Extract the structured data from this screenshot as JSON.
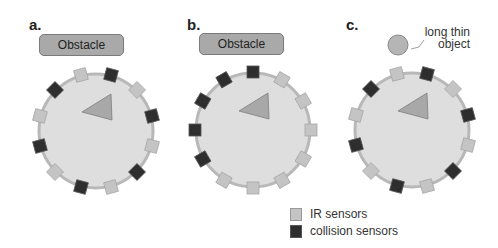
{
  "panels": [
    {
      "label": "a.",
      "target": "Obstacle",
      "target_type": "obstacle-box",
      "center": [
        96,
        131
      ],
      "sensor_start_angle": -105,
      "sensor_pattern": [
        "ir",
        "collision",
        "ir",
        "collision",
        "ir",
        "collision",
        "ir",
        "collision",
        "ir",
        "collision",
        "ir",
        "collision"
      ]
    },
    {
      "label": "b.",
      "target": "Obstacle",
      "target_type": "obstacle-box",
      "center": [
        253,
        130
      ],
      "sensor_start_angle": -90,
      "sensor_pattern": [
        "collision",
        "ir",
        "ir",
        "ir",
        "ir",
        "ir",
        "ir",
        "ir",
        "collision",
        "collision",
        "collision",
        "collision"
      ]
    },
    {
      "label": "c.",
      "target": "long thin\nobject",
      "target_line1": "long thin",
      "target_line2": "object",
      "target_type": "circle-object",
      "center": [
        412,
        130
      ],
      "sensor_start_angle": -105,
      "sensor_pattern": [
        "ir",
        "collision",
        "ir",
        "collision",
        "ir",
        "collision",
        "ir",
        "collision",
        "ir",
        "collision",
        "ir",
        "collision"
      ]
    }
  ],
  "legend": {
    "ir": {
      "label": "IR sensors",
      "color": "#c4c4c4"
    },
    "collision": {
      "label": "collision sensors",
      "color": "#2e2e2e"
    }
  },
  "colors": {
    "robot_body": "#dedede",
    "robot_rim": "#b8b8b8",
    "heading_triangle": "#a8a8a8",
    "obstacle": "#a9a9a9"
  }
}
